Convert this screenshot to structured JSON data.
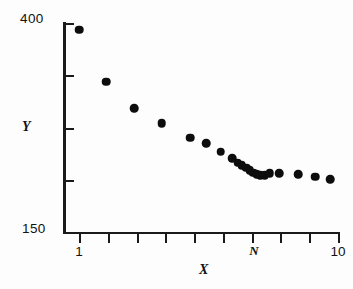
{
  "chart_data": {
    "type": "scatter",
    "title": "",
    "xlabel": "X",
    "ylabel": "Y",
    "grid": false,
    "legend": null,
    "ylim": [
      150,
      400
    ],
    "ytick_labels": [
      "400",
      "150"
    ],
    "ytick_values": [
      400,
      150
    ],
    "xtick_labels": [
      "1",
      "N",
      "10"
    ],
    "xlim": [
      1,
      10
    ],
    "n_xticks": 10,
    "n_yticks": 5,
    "marker": "filled-circle",
    "marker_color": "#0d0d0d",
    "points": [
      {
        "x": 1.0,
        "y": 392
      },
      {
        "x": 1.95,
        "y": 330
      },
      {
        "x": 2.92,
        "y": 298
      },
      {
        "x": 3.88,
        "y": 280
      },
      {
        "x": 4.86,
        "y": 263
      },
      {
        "x": 5.42,
        "y": 256
      },
      {
        "x": 5.93,
        "y": 246
      },
      {
        "x": 6.32,
        "y": 238
      },
      {
        "x": 6.52,
        "y": 233
      },
      {
        "x": 6.66,
        "y": 230
      },
      {
        "x": 6.8,
        "y": 227
      },
      {
        "x": 6.93,
        "y": 224
      },
      {
        "x": 7.05,
        "y": 221
      },
      {
        "x": 7.18,
        "y": 219
      },
      {
        "x": 7.3,
        "y": 218
      },
      {
        "x": 7.46,
        "y": 218
      },
      {
        "x": 7.62,
        "y": 220
      },
      {
        "x": 7.95,
        "y": 220
      },
      {
        "x": 8.62,
        "y": 219
      },
      {
        "x": 9.2,
        "y": 216
      },
      {
        "x": 9.72,
        "y": 213
      }
    ]
  },
  "axes": {
    "y_top_label": "400",
    "y_bottom_label": "150",
    "y_title": "Y",
    "x_title": "X",
    "x_left_label": "1",
    "x_mid_label": "N",
    "x_right_label": "10"
  }
}
